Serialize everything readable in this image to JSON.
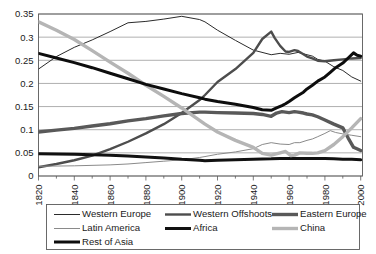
{
  "chart_data": {
    "type": "line",
    "title": "",
    "subtitle": "",
    "xlabel": "",
    "ylabel": "",
    "xlim": [
      1820,
      2001
    ],
    "ylim": [
      0,
      0.35
    ],
    "grid": true,
    "grid_axis": "y",
    "legend_position": "bottom",
    "x_ticks": [
      1820,
      1840,
      1860,
      1880,
      1900,
      1920,
      1940,
      1960,
      1980,
      2000
    ],
    "x_minor_ticks": [
      1830,
      1850,
      1870,
      1890,
      1910,
      1930,
      1950,
      1970,
      1990
    ],
    "x_tick_labels": [
      "1820",
      "1840",
      "1860",
      "1880",
      "1900",
      "1920",
      "1940",
      "1960",
      "1980",
      "2000"
    ],
    "y_ticks": [
      0,
      0.05,
      0.1,
      0.15,
      0.2,
      0.25,
      0.3,
      0.35
    ],
    "y_tick_labels": [
      "0",
      "0.05",
      "0.1",
      "0.15",
      "0.2",
      "0.25",
      "0.3",
      "0.35"
    ],
    "series": [
      {
        "name": "Western Europe",
        "color": "#2b2b2b",
        "width": 1.0,
        "x": [
          1820,
          1830,
          1840,
          1850,
          1860,
          1870,
          1880,
          1890,
          1900,
          1910,
          1913,
          1920,
          1930,
          1940,
          1950,
          1955,
          1960,
          1965,
          1970,
          1973,
          1976,
          1980,
          1985,
          1990,
          1995,
          2000
        ],
        "values": [
          0.231,
          0.258,
          0.278,
          0.294,
          0.312,
          0.331,
          0.334,
          0.339,
          0.345,
          0.338,
          0.333,
          0.315,
          0.293,
          0.272,
          0.262,
          0.265,
          0.263,
          0.267,
          0.262,
          0.259,
          0.252,
          0.248,
          0.236,
          0.228,
          0.214,
          0.205
        ]
      },
      {
        "name": "Western Offshoots",
        "color": "#4d4d4d",
        "width": 2.4,
        "x": [
          1820,
          1830,
          1840,
          1850,
          1860,
          1870,
          1880,
          1890,
          1900,
          1910,
          1913,
          1920,
          1930,
          1940,
          1945,
          1950,
          1952,
          1955,
          1958,
          1960,
          1963,
          1965,
          1968,
          1970,
          1973,
          1976,
          1980,
          1985,
          1990,
          1995,
          2000
        ],
        "values": [
          0.019,
          0.026,
          0.034,
          0.044,
          0.058,
          0.074,
          0.092,
          0.112,
          0.136,
          0.164,
          0.175,
          0.203,
          0.231,
          0.266,
          0.296,
          0.312,
          0.298,
          0.281,
          0.269,
          0.268,
          0.272,
          0.27,
          0.263,
          0.258,
          0.254,
          0.249,
          0.248,
          0.25,
          0.252,
          0.254,
          0.255
        ]
      },
      {
        "name": "Eastern Europe",
        "color": "#595959",
        "width": 3.4,
        "x": [
          1820,
          1830,
          1840,
          1850,
          1860,
          1870,
          1880,
          1890,
          1900,
          1910,
          1913,
          1920,
          1930,
          1940,
          1945,
          1950,
          1953,
          1956,
          1960,
          1963,
          1965,
          1968,
          1970,
          1973,
          1976,
          1980,
          1985,
          1990,
          1993,
          1996,
          2000
        ],
        "values": [
          0.095,
          0.099,
          0.103,
          0.108,
          0.113,
          0.119,
          0.124,
          0.13,
          0.135,
          0.138,
          0.138,
          0.137,
          0.136,
          0.135,
          0.133,
          0.129,
          0.136,
          0.139,
          0.137,
          0.139,
          0.138,
          0.136,
          0.134,
          0.132,
          0.128,
          0.121,
          0.112,
          0.104,
          0.082,
          0.062,
          0.055
        ]
      },
      {
        "name": "Latin America",
        "color": "#8a8a8a",
        "width": 1.0,
        "x": [
          1820,
          1840,
          1860,
          1870,
          1880,
          1890,
          1900,
          1910,
          1913,
          1920,
          1930,
          1940,
          1945,
          1950,
          1955,
          1960,
          1963,
          1966,
          1970,
          1973,
          1976,
          1980,
          1983,
          1986,
          1990,
          1995,
          2000
        ],
        "values": [
          0.021,
          0.022,
          0.024,
          0.026,
          0.029,
          0.032,
          0.035,
          0.04,
          0.042,
          0.047,
          0.052,
          0.059,
          0.068,
          0.072,
          0.069,
          0.068,
          0.072,
          0.072,
          0.077,
          0.08,
          0.085,
          0.092,
          0.098,
          0.094,
          0.091,
          0.088,
          0.085
        ]
      },
      {
        "name": "Africa",
        "color": "#111111",
        "width": 3.0,
        "x": [
          1820,
          1840,
          1860,
          1870,
          1880,
          1890,
          1900,
          1910,
          1913,
          1920,
          1930,
          1940,
          1950,
          1955,
          1960,
          1965,
          1970,
          1973,
          1976,
          1980,
          1985,
          1990,
          1995,
          2000
        ],
        "values": [
          0.048,
          0.047,
          0.045,
          0.043,
          0.041,
          0.039,
          0.036,
          0.034,
          0.033,
          0.034,
          0.035,
          0.036,
          0.037,
          0.038,
          0.038,
          0.038,
          0.038,
          0.038,
          0.038,
          0.038,
          0.037,
          0.036,
          0.036,
          0.035
        ]
      },
      {
        "name": "China",
        "color": "#b5b5b5",
        "width": 3.4,
        "x": [
          1820,
          1830,
          1840,
          1850,
          1860,
          1870,
          1880,
          1890,
          1900,
          1910,
          1913,
          1920,
          1930,
          1940,
          1945,
          1950,
          1955,
          1958,
          1961,
          1963,
          1966,
          1970,
          1973,
          1976,
          1980,
          1985,
          1990,
          1995,
          2000
        ],
        "values": [
          0.333,
          0.315,
          0.295,
          0.271,
          0.246,
          0.222,
          0.196,
          0.172,
          0.147,
          0.12,
          0.112,
          0.095,
          0.077,
          0.062,
          0.049,
          0.045,
          0.05,
          0.053,
          0.044,
          0.045,
          0.05,
          0.049,
          0.049,
          0.05,
          0.055,
          0.068,
          0.085,
          0.104,
          0.124
        ]
      },
      {
        "name": "Rest of Asia",
        "color": "#0d0d0d",
        "width": 3.0,
        "x": [
          1820,
          1830,
          1840,
          1850,
          1860,
          1870,
          1880,
          1890,
          1900,
          1910,
          1913,
          1920,
          1930,
          1940,
          1945,
          1950,
          1953,
          1956,
          1958,
          1960,
          1963,
          1965,
          1968,
          1970,
          1973,
          1976,
          1980,
          1983,
          1986,
          1990,
          1993,
          1996,
          1998,
          2000
        ],
        "values": [
          0.265,
          0.255,
          0.245,
          0.234,
          0.222,
          0.21,
          0.198,
          0.188,
          0.178,
          0.169,
          0.166,
          0.161,
          0.155,
          0.148,
          0.143,
          0.142,
          0.147,
          0.152,
          0.156,
          0.161,
          0.169,
          0.174,
          0.181,
          0.188,
          0.196,
          0.205,
          0.214,
          0.224,
          0.234,
          0.244,
          0.255,
          0.266,
          0.261,
          0.259
        ]
      }
    ],
    "legend": [
      {
        "label": "Western Europe",
        "color": "#2b2b2b",
        "width": 1.0
      },
      {
        "label": "Western Offshoots",
        "color": "#4d4d4d",
        "width": 2.4
      },
      {
        "label": "Eastern Europe",
        "color": "#595959",
        "width": 3.4
      },
      {
        "label": "Latin America",
        "color": "#8a8a8a",
        "width": 1.0
      },
      {
        "label": "Africa",
        "color": "#111111",
        "width": 3.0
      },
      {
        "label": "China",
        "color": "#b5b5b5",
        "width": 3.4
      },
      {
        "label": "Rest of Asia",
        "color": "#0d0d0d",
        "width": 3.0
      }
    ]
  }
}
